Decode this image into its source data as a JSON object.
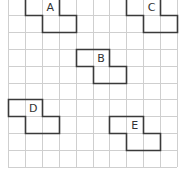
{
  "grid": {
    "origin_x": 8,
    "origin_y": -2,
    "cell": 16.9,
    "cols": 10,
    "rows": 10,
    "line_color": "#cfcfcf"
  },
  "shapes": [
    {
      "label": "A",
      "cells": [
        [
          0,
          1
        ],
        [
          0,
          2
        ],
        [
          1,
          2
        ],
        [
          1,
          3
        ]
      ],
      "label_cell": [
        0,
        2
      ]
    },
    {
      "label": "B",
      "cells": [
        [
          3,
          4
        ],
        [
          3,
          5
        ],
        [
          4,
          5
        ],
        [
          4,
          6
        ]
      ],
      "label_cell": [
        3,
        5
      ]
    },
    {
      "label": "C",
      "cells": [
        [
          0,
          7
        ],
        [
          0,
          8
        ],
        [
          1,
          8
        ],
        [
          1,
          9
        ]
      ],
      "label_cell": [
        0,
        8
      ]
    },
    {
      "label": "D",
      "cells": [
        [
          6,
          0
        ],
        [
          6,
          1
        ],
        [
          7,
          1
        ],
        [
          7,
          2
        ]
      ],
      "label_cell": [
        6,
        1
      ]
    },
    {
      "label": "E",
      "cells": [
        [
          7,
          6
        ],
        [
          7,
          7
        ],
        [
          8,
          7
        ],
        [
          8,
          8
        ]
      ],
      "label_cell": [
        7,
        7
      ]
    }
  ],
  "outline_color": "#3a3a3a"
}
